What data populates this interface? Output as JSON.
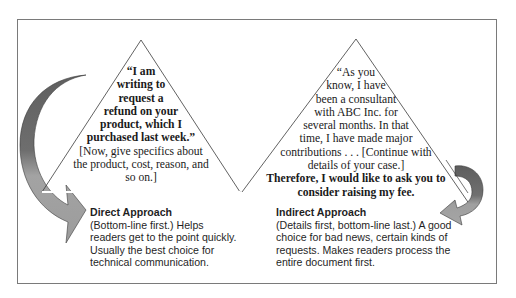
{
  "colors": {
    "frame_border": "#7a7a7a",
    "triangle_stroke": "#3a3a3a",
    "arrow_dark": "#6a6a6a",
    "arrow_light": "#9a9a9a",
    "text": "#1a1a1a"
  },
  "direct": {
    "triangle_lines": [
      {
        "text": "“I am",
        "bold": true
      },
      {
        "text": "writing to",
        "bold": true
      },
      {
        "text": "request a",
        "bold": true
      },
      {
        "text": "refund on your",
        "bold": true
      },
      {
        "text": "product, which I",
        "bold": true
      },
      {
        "text": "purchased last week.”",
        "bold": true
      },
      {
        "text": "[Now, give specifics about",
        "bold": false
      },
      {
        "text": "the product, cost, reason, and",
        "bold": false
      },
      {
        "text": "so on.]",
        "bold": false
      }
    ],
    "caption": {
      "title": "Direct Approach",
      "lines": [
        "(Bottom-line first.) Helps",
        "readers get to the point quickly.",
        "Usually the best choice for",
        "technical communication."
      ]
    },
    "arrow_icon": "curved-arrow-down-right"
  },
  "indirect": {
    "triangle_lines": [
      {
        "text": "“As you",
        "bold": false
      },
      {
        "text": "know, I have",
        "bold": false
      },
      {
        "text": "been a consultant",
        "bold": false
      },
      {
        "text": "with ABC Inc. for",
        "bold": false
      },
      {
        "text": "several months. In that",
        "bold": false
      },
      {
        "text": "time, I have made major",
        "bold": false
      },
      {
        "text": "contributions . . . [Continue with",
        "bold": false
      },
      {
        "text": "details of your case.]",
        "bold": false
      },
      {
        "text": "Therefore, I would like to ask you to",
        "bold": true
      },
      {
        "text": "consider raising my fee.",
        "bold": true
      }
    ],
    "caption": {
      "title": "Indirect Approach",
      "lines": [
        "(Details first, bottom-line last.) A good",
        "choice for bad news, certain kinds of",
        "requests. Makes readers process the",
        "entire document first."
      ]
    },
    "arrow_icon": "curved-arrow-down-left"
  }
}
